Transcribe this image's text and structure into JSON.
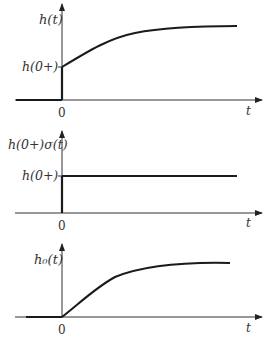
{
  "panels": [
    {
      "id": "h",
      "y_label": "h(t)",
      "level_label": "h(0+)",
      "origin_label": "0",
      "x_label": "t",
      "curve": "step jump to h(0+) at t=0 then exponential rise to steady value"
    },
    {
      "id": "step",
      "y_label": "h(0+)σ(t)",
      "level_label": "h(0+)",
      "origin_label": "0",
      "x_label": "t",
      "curve": "constant h(0+) for t>0 (step function)"
    },
    {
      "id": "h0",
      "y_label": "h₀(t)",
      "level_label": "",
      "origin_label": "0",
      "x_label": "t",
      "curve": "starts at 0 at t=0 and rises exponentially to steady value"
    }
  ],
  "colors": {
    "line": "#1a1a1a",
    "axis": "#333333",
    "text": "#333333"
  }
}
